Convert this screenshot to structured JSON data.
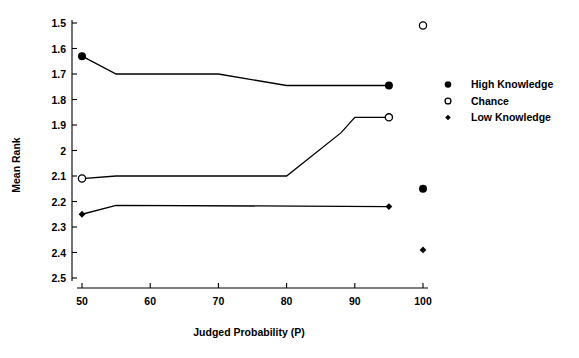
{
  "chart_data": {
    "type": "line",
    "title": "",
    "xlabel": "Judged Probability (P)",
    "ylabel": "Mean Rank",
    "xlim": [
      50,
      100
    ],
    "ylim": [
      1.5,
      2.5
    ],
    "y_inverted": true,
    "grid": false,
    "legend_position": "right",
    "xticks": [
      50,
      60,
      70,
      80,
      90,
      100
    ],
    "xtick_labels": [
      "50",
      "60",
      "70",
      "80",
      "90",
      "100"
    ],
    "yticks": [
      1.5,
      1.6,
      1.7,
      1.8,
      1.9,
      2.0,
      2.1,
      2.2,
      2.3,
      2.4,
      2.5
    ],
    "ytick_labels": [
      "1.5",
      "1.6",
      "1.7",
      "1.8",
      "1.9",
      "2",
      "2.1",
      "2.2",
      "2.3",
      "2.4",
      "2.5"
    ],
    "series": [
      {
        "name": "High Knowledge",
        "marker": "filled-circle",
        "x": [
          50,
          55,
          70,
          80,
          95
        ],
        "values": [
          1.63,
          1.7,
          1.7,
          1.745,
          1.745
        ],
        "marker_points": [
          {
            "x": 50,
            "y": 1.63
          },
          {
            "x": 95,
            "y": 1.745
          }
        ],
        "isolated_points": [
          {
            "x": 100,
            "y": 2.15
          }
        ]
      },
      {
        "name": "Chance",
        "marker": "open-circle",
        "x": [
          50,
          55,
          80,
          88,
          90,
          95
        ],
        "values": [
          2.11,
          2.1,
          2.1,
          1.93,
          1.87,
          1.87
        ],
        "marker_points": [
          {
            "x": 50,
            "y": 2.11
          },
          {
            "x": 95,
            "y": 1.87
          }
        ],
        "isolated_points": [
          {
            "x": 100,
            "y": 1.51
          }
        ]
      },
      {
        "name": "Low Knowledge",
        "marker": "diamond",
        "x": [
          50,
          55,
          95
        ],
        "values": [
          2.25,
          2.215,
          2.22
        ],
        "marker_points": [
          {
            "x": 50,
            "y": 2.25
          },
          {
            "x": 95,
            "y": 2.22
          }
        ],
        "isolated_points": [
          {
            "x": 100,
            "y": 2.39
          }
        ]
      }
    ]
  },
  "legend": {
    "entries": [
      {
        "label": "High Knowledge",
        "marker": "filled-circle"
      },
      {
        "label": "Chance",
        "marker": "open-circle"
      },
      {
        "label": "Low Knowledge",
        "marker": "diamond"
      }
    ]
  },
  "axes": {
    "x_title": "Judged Probability (P)",
    "y_title": "Mean Rank"
  }
}
